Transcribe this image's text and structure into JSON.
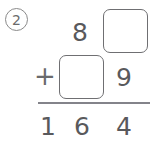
{
  "worksheet": {
    "problem_number": "2",
    "problem_type": "addition-with-missing-digits",
    "columns": [
      "hundreds",
      "tens",
      "ones"
    ],
    "rows": {
      "addend_top": {
        "hundreds": "",
        "tens": "8",
        "ones": ""
      },
      "addend_bottom": {
        "operator": "+",
        "hundreds": "",
        "tens": "",
        "ones": "9"
      },
      "sum": {
        "hundreds": "1",
        "tens": "6",
        "ones": "4"
      }
    },
    "blanks": [
      {
        "id": "box-ones-top",
        "row": "addend_top",
        "column": "ones",
        "value": ""
      },
      {
        "id": "box-tens-mid",
        "row": "addend_bottom",
        "column": "tens",
        "value": ""
      }
    ],
    "colors": {
      "ink": "#59595c",
      "box_border": "#6f6f72",
      "rule": "#83838a",
      "circle_border": "#8a8a8a",
      "background": "#ffffff"
    }
  }
}
